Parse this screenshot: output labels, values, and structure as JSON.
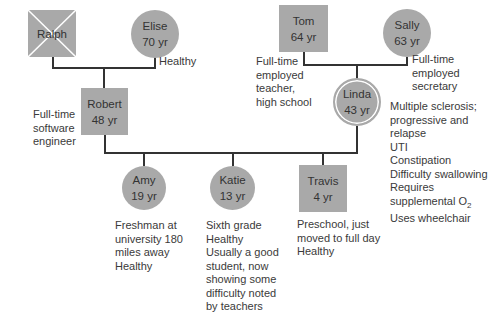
{
  "colors": {
    "node_fill": "#a9a9a9",
    "line": "#333333",
    "text": "#3a3a3a"
  },
  "members": {
    "ralph": {
      "name": "Ralph",
      "age": "",
      "shape": "square",
      "deceased": true
    },
    "elise": {
      "name": "Elise",
      "age": "70 yr",
      "shape": "circle",
      "notes": [
        "Healthy"
      ]
    },
    "tom": {
      "name": "Tom",
      "age": "64 yr",
      "shape": "square",
      "notes": [
        "Full-time",
        "employed",
        "teacher,",
        "high school"
      ]
    },
    "sally": {
      "name": "Sally",
      "age": "63 yr",
      "shape": "circle",
      "notes": [
        "Full-time",
        "employed",
        "secretary"
      ]
    },
    "robert": {
      "name": "Robert",
      "age": "48 yr",
      "shape": "square",
      "notes": [
        "Full-time",
        "software",
        "engineer"
      ]
    },
    "linda": {
      "name": "Linda",
      "age": "43 yr",
      "shape": "double-circle",
      "notes": [
        "Multiple sclerosis;",
        "progressive and",
        "relapse",
        "UTI",
        "Constipation",
        "Difficulty swallowing",
        "Requires",
        "supplemental O",
        "Uses wheelchair"
      ],
      "o2_subscript": "2"
    },
    "amy": {
      "name": "Amy",
      "age": "19 yr",
      "shape": "circle",
      "notes": [
        "Freshman at",
        "university 180",
        "miles away",
        "Healthy"
      ]
    },
    "katie": {
      "name": "Katie",
      "age": "13 yr",
      "shape": "circle",
      "notes": [
        "Sixth grade",
        "Healthy",
        "Usually a good",
        "student, now",
        "showing some",
        "difficulty noted",
        "by teachers"
      ]
    },
    "travis": {
      "name": "Travis",
      "age": "4 yr",
      "shape": "square",
      "notes": [
        "Preschool, just",
        "moved to full day",
        "Healthy"
      ]
    }
  }
}
